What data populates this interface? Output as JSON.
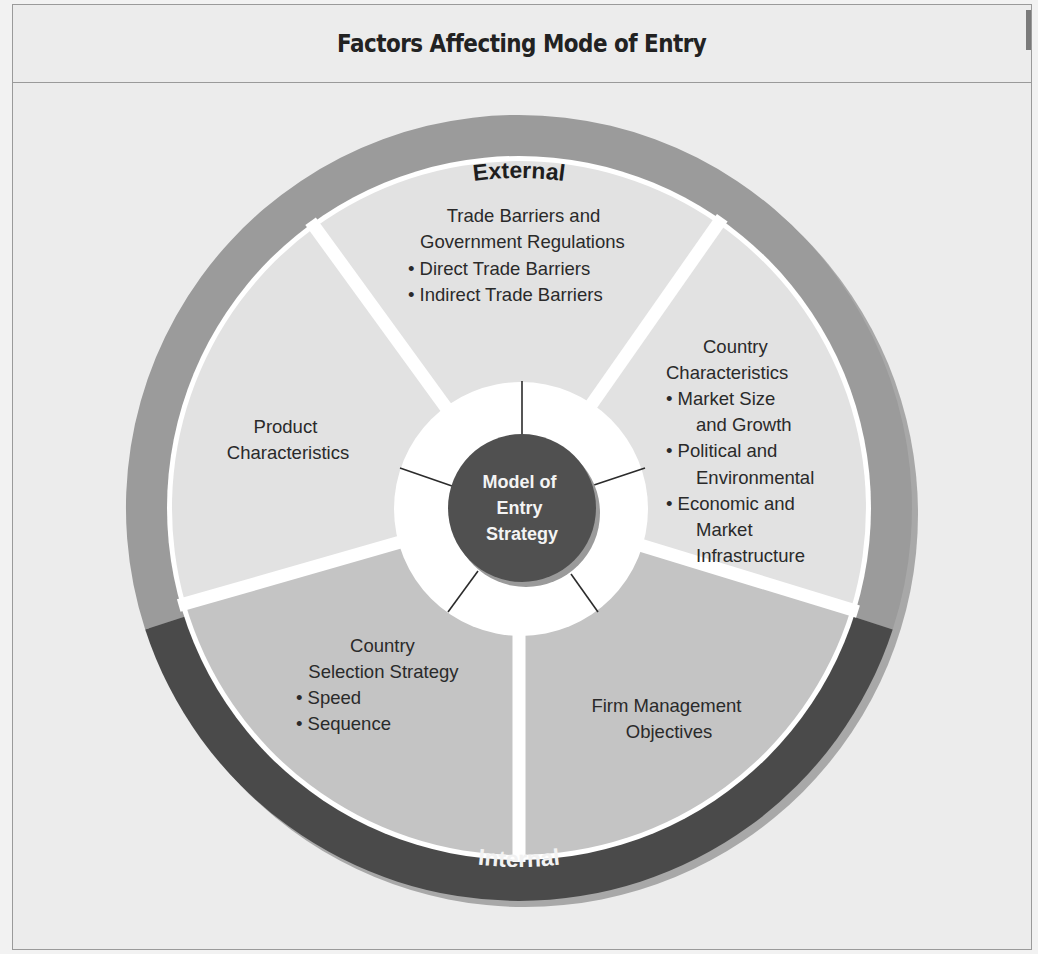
{
  "header": {
    "title": "Factors Affecting Mode of Entry"
  },
  "ring": {
    "external_label": "External",
    "internal_label": "Internal"
  },
  "center": {
    "lines": [
      "Model of",
      "Entry",
      "Strategy"
    ]
  },
  "segments": [
    {
      "id": "trade-barriers",
      "group": "External",
      "lines": [
        "Trade Barriers and",
        "Government Regulations",
        "•  Direct Trade Barriers",
        "• Indirect Trade Barriers"
      ]
    },
    {
      "id": "country-characteristics",
      "group": "External",
      "lines": [
        "Country",
        "Characteristics",
        "• Market Size",
        "and Growth",
        "• Political and",
        "Environmental",
        "• Economic and",
        "Market",
        "Infrastructure"
      ]
    },
    {
      "id": "product-characteristics",
      "group": "External",
      "lines": [
        "Product",
        "Characteristics"
      ]
    },
    {
      "id": "country-selection-strategy",
      "group": "Internal",
      "lines": [
        "Country",
        "Selection Strategy",
        "• Speed",
        "• Sequence"
      ]
    },
    {
      "id": "firm-management-objectives",
      "group": "Internal",
      "lines": [
        "Firm Management",
        "Objectives"
      ]
    }
  ],
  "colors": {
    "background": "#ececec",
    "external_ring": "#9b9b9b",
    "internal_ring": "#4a4a4a",
    "ring_shadow": "#a8a8a8",
    "external_segment": "#e2e2e2",
    "internal_segment": "#c4c4c4",
    "center_circle": "#505050",
    "separator": "#ffffff"
  }
}
